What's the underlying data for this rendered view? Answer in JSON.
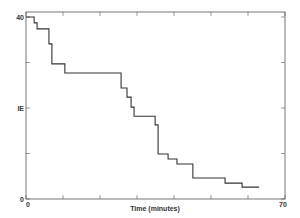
{
  "chart_data": {
    "type": "line",
    "subtype": "step",
    "title": "",
    "xlabel": "Time (minutes)",
    "ylabel": "",
    "xlim": [
      0,
      70
    ],
    "ylim": [
      0,
      40
    ],
    "x_tick_labels": [
      {
        "value": 0,
        "label": "0"
      },
      {
        "value": 70,
        "label": "70"
      }
    ],
    "x_ticks": [
      0,
      10,
      20,
      30,
      40,
      50,
      60,
      70
    ],
    "y_tick_labels": [
      {
        "value": 0,
        "label": "0"
      },
      {
        "value": 20,
        "label": "IE"
      },
      {
        "value": 40,
        "label": "40"
      }
    ],
    "y_ticks": [
      0,
      10,
      20,
      30,
      40
    ],
    "grid": false,
    "legend": null,
    "series": [
      {
        "name": "step-curve",
        "color": "#333333",
        "x": [
          0,
          2.2,
          3.0,
          6.2,
          7.0,
          10.5,
          25.7,
          27.3,
          28.4,
          29.2,
          34.9,
          35.7,
          38.4,
          40.8,
          45.1,
          53.8,
          58.4,
          63.0
        ],
        "values": [
          40,
          38.7,
          37.4,
          34.1,
          29.7,
          27.7,
          24.4,
          22.4,
          20.2,
          18.2,
          16.3,
          9.9,
          8.8,
          7.7,
          4.6,
          3.5,
          2.6,
          2.6
        ]
      }
    ]
  },
  "colors": {
    "frame": "#555555",
    "line": "#333333",
    "text": "#333333",
    "background": "#ffffff"
  }
}
